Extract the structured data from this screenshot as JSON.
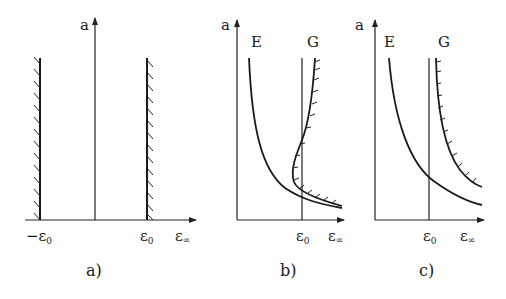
{
  "figure": {
    "panels": [
      {
        "id": "a",
        "caption": "a)",
        "y_axis_label": "a",
        "x_axis_label": "ε∞",
        "x_ticks": [
          {
            "label": "−ε",
            "sub": "0"
          },
          {
            "label": "ε",
            "sub": "0"
          }
        ],
        "x_axis_label_main": "ε",
        "x_axis_label_sub": "∞",
        "elements": [
          "hatched vertical boundary at −ε0",
          "hatched vertical boundary at ε0"
        ]
      },
      {
        "id": "b",
        "caption": "b)",
        "y_axis_label": "a",
        "x_axis_label_main": "ε",
        "x_axis_label_sub": "∞",
        "x_tick": {
          "label": "ε",
          "sub": "0"
        },
        "curve_labels": {
          "E": "E",
          "G": "G"
        },
        "elements": [
          "curve E",
          "hatched curve G with S-bend crossing ε0",
          "vertical line at ε0"
        ]
      },
      {
        "id": "c",
        "caption": "c)",
        "y_axis_label": "a",
        "x_axis_label_main": "ε",
        "x_axis_label_sub": "∞",
        "x_tick": {
          "label": "ε",
          "sub": "0"
        },
        "curve_labels": {
          "E": "E",
          "G": "G"
        },
        "elements": [
          "curve E crossing ε0",
          "hatched curve G right of ε0",
          "vertical line at ε0"
        ]
      }
    ],
    "colors": {
      "ink": "#1a1a1a",
      "background": "#ffffff"
    }
  }
}
